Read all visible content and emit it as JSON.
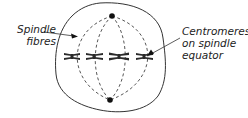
{
  "diagram": {
    "type": "cell-division-metaphase",
    "labels": {
      "spindle_fibres": [
        "Spindle",
        "fibres"
      ],
      "centromeres": [
        "Centromeres",
        "on spindle",
        "equator"
      ]
    },
    "elements": {
      "cell_membrane": "irregular rounded outline",
      "poles": 2,
      "chromosomes_on_equator": 4,
      "spindle_fibres": "dashed curved lines from pole to pole"
    },
    "colors": {
      "line": "#333333",
      "chromosome": "#2a2a2a",
      "background": "#ffffff"
    }
  }
}
